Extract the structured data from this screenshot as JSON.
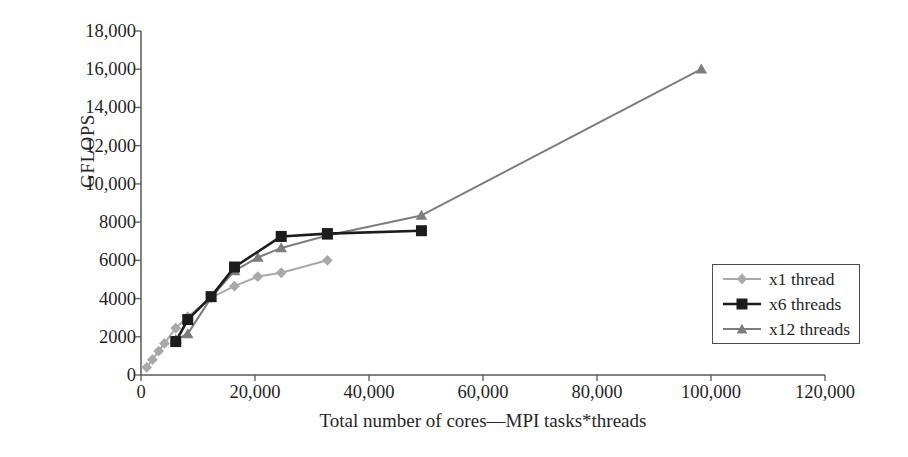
{
  "chart_data": {
    "type": "line",
    "title": "",
    "subtitle": "",
    "xlabel": "Total number of cores—MPI tasks*threads",
    "ylabel": "GFLOPS",
    "xlim": [
      0,
      120000
    ],
    "ylim": [
      0,
      18000
    ],
    "grid": false,
    "legend_position": "right-inside",
    "xticks": [
      0,
      20000,
      40000,
      60000,
      80000,
      100000,
      120000
    ],
    "xtick_labels": [
      "0",
      "20,000",
      "40,000",
      "60,000",
      "80,000",
      "100,000",
      "120,000"
    ],
    "yticks": [
      0,
      2000,
      4000,
      6000,
      8000,
      10000,
      12000,
      14000,
      16000,
      18000
    ],
    "ytick_labels": [
      "0",
      "2000",
      "4000",
      "6000",
      "8000",
      "10,000",
      "12,000",
      "14,000",
      "16,000",
      "18,000"
    ],
    "series": [
      {
        "name": "x1 thread",
        "color": "#a9a9a9",
        "marker": "diamond",
        "x": [
          1000,
          2000,
          3100,
          4100,
          6100,
          8200,
          12300,
          16400,
          20500,
          24600,
          32700
        ],
        "y": [
          400,
          800,
          1250,
          1650,
          2450,
          3050,
          4050,
          4650,
          5150,
          5350,
          6000
        ]
      },
      {
        "name": "x6 threads",
        "color": "#1c1c1c",
        "marker": "square",
        "x": [
          6100,
          8200,
          12300,
          16400,
          24600,
          32700,
          49200
        ],
        "y": [
          1750,
          2900,
          4100,
          5650,
          7250,
          7400,
          7550
        ]
      },
      {
        "name": "x12 threads",
        "color": "#7d7d7d",
        "marker": "triangle",
        "x": [
          6100,
          8200,
          12300,
          16400,
          20500,
          24600,
          32700,
          49200,
          98300
        ],
        "y": [
          1850,
          2150,
          4050,
          5450,
          6150,
          6650,
          7300,
          8350,
          16000
        ]
      }
    ]
  },
  "legend": {
    "entries": [
      {
        "label": "x1 thread"
      },
      {
        "label": "x6 threads"
      },
      {
        "label": "x12 threads"
      }
    ]
  },
  "axes": {
    "y_title": "GFLOPS",
    "x_title": "Total number of cores—MPI tasks*threads"
  }
}
